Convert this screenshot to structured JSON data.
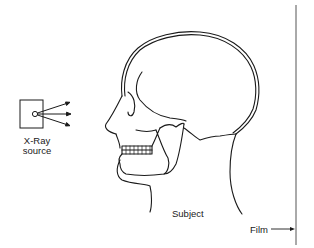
{
  "diagram": {
    "labels": {
      "source_line1": "X-Ray",
      "source_line2": "source",
      "subject": "Subject",
      "film": "Film"
    },
    "elements": [
      {
        "id": "xray-source",
        "shape": "square box with small circle emitter",
        "arrows": 3
      },
      {
        "id": "subject",
        "shape": "lateral head/skull outline facing left"
      },
      {
        "id": "film",
        "shape": "vertical line on right",
        "pointer": "arrow from Film label"
      }
    ],
    "colors": {
      "stroke": "#1a1a1a",
      "background": "#ffffff",
      "film_line": "#555555"
    }
  }
}
